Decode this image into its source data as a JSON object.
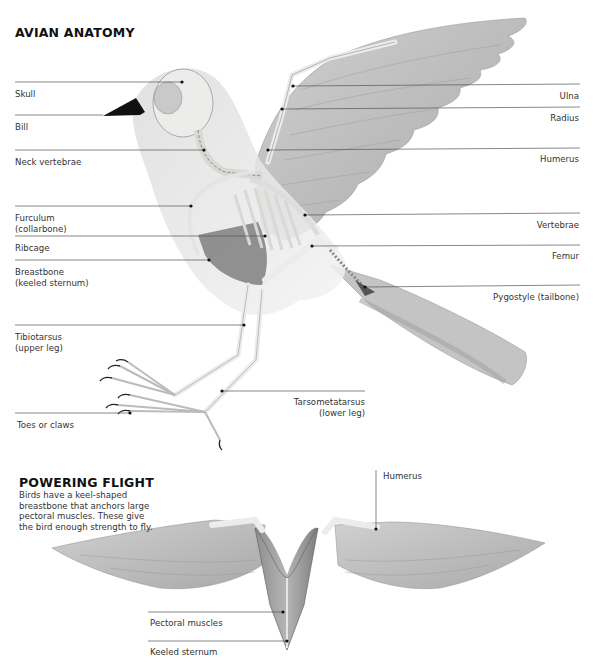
{
  "main_diagram": {
    "title": "AVIAN ANATOMY",
    "left_labels": [
      {
        "id": "skull",
        "text": "Skull"
      },
      {
        "id": "bill",
        "text": "Bill"
      },
      {
        "id": "neck",
        "text": "Neck vertebrae"
      },
      {
        "id": "furculum",
        "text": "Furculum\n(collarbone)"
      },
      {
        "id": "ribcage",
        "text": "Ribcage"
      },
      {
        "id": "breastbone",
        "text": "Breastbone\n(keeled sternum)"
      },
      {
        "id": "tibiotarsus",
        "text": "Tibiotarsus\n(upper leg)"
      },
      {
        "id": "toes",
        "text": "Toes or claws"
      }
    ],
    "right_labels": [
      {
        "id": "ulna",
        "text": "Ulna"
      },
      {
        "id": "radius",
        "text": "Radius"
      },
      {
        "id": "humerus",
        "text": "Humerus"
      },
      {
        "id": "vertebrae",
        "text": "Vertebrae"
      },
      {
        "id": "femur",
        "text": "Femur"
      },
      {
        "id": "pygostyle",
        "text": "Pygostyle (tailbone)"
      },
      {
        "id": "tarsometatarsus",
        "text": "Tarsometatarsus\n(lower leg)"
      }
    ]
  },
  "flight_diagram": {
    "title": "POWERING FLIGHT",
    "description": "Birds have a keel-shaped breastbone that anchors large pectoral muscles. These give the bird enough strength to fly.",
    "labels": [
      {
        "id": "humerus2",
        "text": "Humerus"
      },
      {
        "id": "pectoral",
        "text": "Pectoral muscles"
      },
      {
        "id": "keeled",
        "text": "Keeled sternum"
      }
    ]
  },
  "colors": {
    "background": "#ffffff",
    "feather": "#b9b9b9",
    "bone": "#e9e9e6",
    "leader_line": "#555555",
    "text": "#333333"
  }
}
